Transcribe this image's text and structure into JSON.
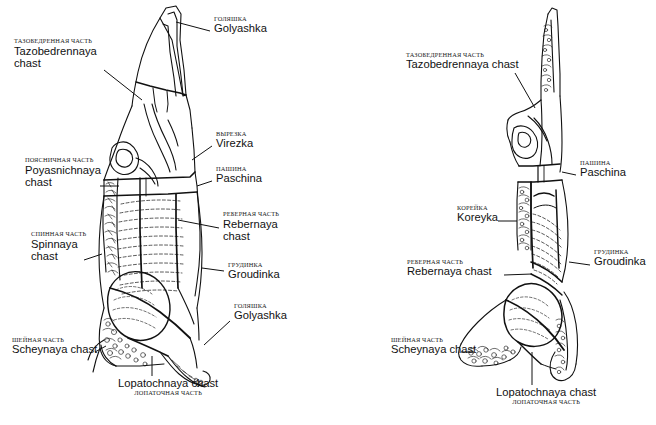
{
  "document": {
    "title": "Beef carcass cutting chart",
    "subject": "Cattle carcass primal cuts — Russian and transliterated names",
    "background_color": "#ffffff",
    "line_color": "#111111"
  },
  "left_diagram": {
    "name": "beef-carcass-rear-view",
    "labels": [
      {
        "id": "golyashka-top",
        "ru": "ГОЛЯШКА",
        "lat": "Golyashka",
        "align": "left",
        "x": 214,
        "y": 16
      },
      {
        "id": "tazobedrennaya",
        "ru": "ТАЗОБЕДРЕННАЯ ЧАСТЬ",
        "lat": "Tazobedrennaya\nchast",
        "align": "left",
        "x": 14,
        "y": 38
      },
      {
        "id": "virezka",
        "ru": "ВЫРЕЗКА",
        "lat": "Virezka",
        "align": "left",
        "x": 216,
        "y": 131
      },
      {
        "id": "poyasnichnaya",
        "ru": "ПОЯСНИЧНАЯ ЧАСТЬ",
        "lat": "Poyasnichnaya\nchast",
        "align": "left",
        "x": 25,
        "y": 157
      },
      {
        "id": "paschina",
        "ru": "ПАШИНА",
        "lat": "Paschina",
        "align": "left",
        "x": 216,
        "y": 166
      },
      {
        "id": "rebernaya",
        "ru": "РЕБЕРНАЯ ЧАСТЬ",
        "lat": "Rebernaya\nchast",
        "align": "left",
        "x": 223,
        "y": 211
      },
      {
        "id": "spinnaya",
        "ru": "СПИННАЯ ЧАСТЬ",
        "lat": "Spinnaya\nchast",
        "align": "left",
        "x": 31,
        "y": 231
      },
      {
        "id": "groudinka",
        "ru": "ГРУДИНКА",
        "lat": "Groudinka",
        "align": "left",
        "x": 228,
        "y": 262
      },
      {
        "id": "golyashka-bottom",
        "ru": "ГОЛЯШКА",
        "lat": "Golyashka",
        "align": "left",
        "x": 234,
        "y": 303
      },
      {
        "id": "scheynaya",
        "ru": "ШЕЙНАЯ ЧАСТЬ",
        "lat": "Scheynaya chast",
        "align": "left",
        "x": 12,
        "y": 337
      },
      {
        "id": "lopatochnaya",
        "ru": "ЛОПАТОЧНАЯ ЧАСТЬ",
        "lat": "Lopatochnaya chast",
        "align": "center",
        "ru_below": true,
        "x": 118,
        "y": 378
      }
    ]
  },
  "right_diagram": {
    "name": "beef-carcass-side-view",
    "labels": [
      {
        "id": "tazobedrennaya",
        "ru": "ТАЗОБЕДРЕННАЯ ЧАСТЬ",
        "lat": "Tazobedrennaya chast",
        "align": "left",
        "x": 78,
        "y": 52
      },
      {
        "id": "paschina",
        "ru": "ПАШИНА",
        "lat": "Paschina",
        "align": "left",
        "x": 252,
        "y": 160
      },
      {
        "id": "koreyka",
        "ru": "КОРЕЙКА",
        "lat": "Koreyka",
        "align": "left",
        "x": 129,
        "y": 205
      },
      {
        "id": "groudinka",
        "ru": "ГРУДИНКА",
        "lat": "Groudinka",
        "align": "left",
        "x": 266,
        "y": 249
      },
      {
        "id": "rebernaya",
        "ru": "РЕБЕРНАЯ ЧАСТЬ",
        "lat": "Rebernaya chast",
        "align": "left",
        "x": 79,
        "y": 259
      },
      {
        "id": "scheynaya",
        "ru": "ШЕЙНАЯ ЧАСТЬ",
        "lat": "Scheynaya chast",
        "align": "left",
        "x": 63,
        "y": 337
      },
      {
        "id": "lopatochnaya",
        "ru": "ЛОПАТОЧНАЯ ЧАСТЬ",
        "lat": "Lopatochnaya chast",
        "align": "center",
        "ru_below": true,
        "x": 168,
        "y": 387
      }
    ]
  }
}
